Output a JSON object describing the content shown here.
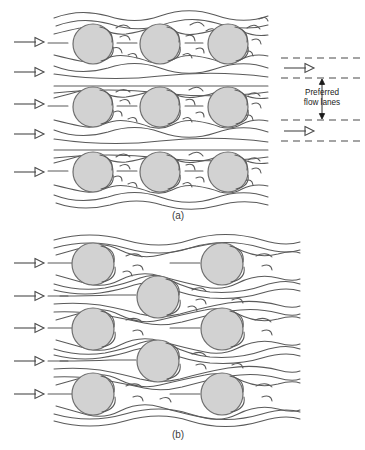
{
  "figure": {
    "type": "flow-diagram",
    "background_color": "#ffffff",
    "panels": [
      {
        "id": "a",
        "caption": "(a)",
        "caption_x": 178,
        "caption_y": 219,
        "arrangement": "in-line",
        "inlet_arrow_count": 5,
        "circle_rows": 3,
        "circles_per_row": 3
      },
      {
        "id": "b",
        "caption": "(b)",
        "caption_x": 178,
        "caption_y": 438,
        "arrangement": "staggered",
        "inlet_arrow_count": 5,
        "circle_rows": 5
      }
    ],
    "annotation": {
      "label_line_1": "Preferred",
      "label_line_2": "flow lanes",
      "label_x": 322,
      "label_y_line_1": 95,
      "label_y_line_2": 105,
      "dashed_line_xs": [
        281,
        365
      ],
      "dashed_line_ys": [
        58,
        78,
        120,
        141
      ],
      "vertical_arrow_x": 322,
      "vertical_arrow_top": 79,
      "vertical_arrow_bottom": 119,
      "outlet_arrows": [
        {
          "x": 286,
          "y": 68,
          "length": 24
        },
        {
          "x": 286,
          "y": 131,
          "length": 24
        }
      ]
    },
    "colors": {
      "circle_fill": "#d2d2d2",
      "circle_stroke": "#6e6e6e",
      "streamline": "#5a5a5a",
      "arrow": "#4a4a4a",
      "dashed": "#4a4a4a",
      "text": "#1a1a1a",
      "caption": "#3c3c3c"
    },
    "panel_a_circles": [
      {
        "cx": 93,
        "cy": 44,
        "r": 20
      },
      {
        "cx": 160,
        "cy": 44,
        "r": 20
      },
      {
        "cx": 228,
        "cy": 44,
        "r": 20
      },
      {
        "cx": 93,
        "cy": 107,
        "r": 20
      },
      {
        "cx": 160,
        "cy": 107,
        "r": 20
      },
      {
        "cx": 228,
        "cy": 107,
        "r": 20
      },
      {
        "cx": 93,
        "cy": 172,
        "r": 20
      },
      {
        "cx": 160,
        "cy": 172,
        "r": 20
      },
      {
        "cx": 228,
        "cy": 172,
        "r": 20
      }
    ],
    "panel_b_circles": [
      {
        "cx": 93,
        "cy": 264,
        "r": 21
      },
      {
        "cx": 222,
        "cy": 264,
        "r": 21
      },
      {
        "cx": 158,
        "cy": 297,
        "r": 21
      },
      {
        "cx": 93,
        "cy": 329,
        "r": 21
      },
      {
        "cx": 222,
        "cy": 329,
        "r": 21
      },
      {
        "cx": 158,
        "cy": 361,
        "r": 21
      },
      {
        "cx": 93,
        "cy": 394,
        "r": 21
      },
      {
        "cx": 222,
        "cy": 394,
        "r": 21
      }
    ],
    "panel_a_inlet_arrows": [
      {
        "x": 14,
        "y": 42,
        "length": 30
      },
      {
        "x": 14,
        "y": 72,
        "length": 30
      },
      {
        "x": 14,
        "y": 104,
        "length": 30
      },
      {
        "x": 14,
        "y": 134,
        "length": 30
      },
      {
        "x": 14,
        "y": 172,
        "length": 30
      }
    ],
    "panel_b_inlet_arrows": [
      {
        "x": 14,
        "y": 263,
        "length": 30
      },
      {
        "x": 14,
        "y": 296,
        "length": 30
      },
      {
        "x": 14,
        "y": 328,
        "length": 30
      },
      {
        "x": 14,
        "y": 361,
        "length": 30
      },
      {
        "x": 14,
        "y": 394,
        "length": 30
      }
    ]
  }
}
